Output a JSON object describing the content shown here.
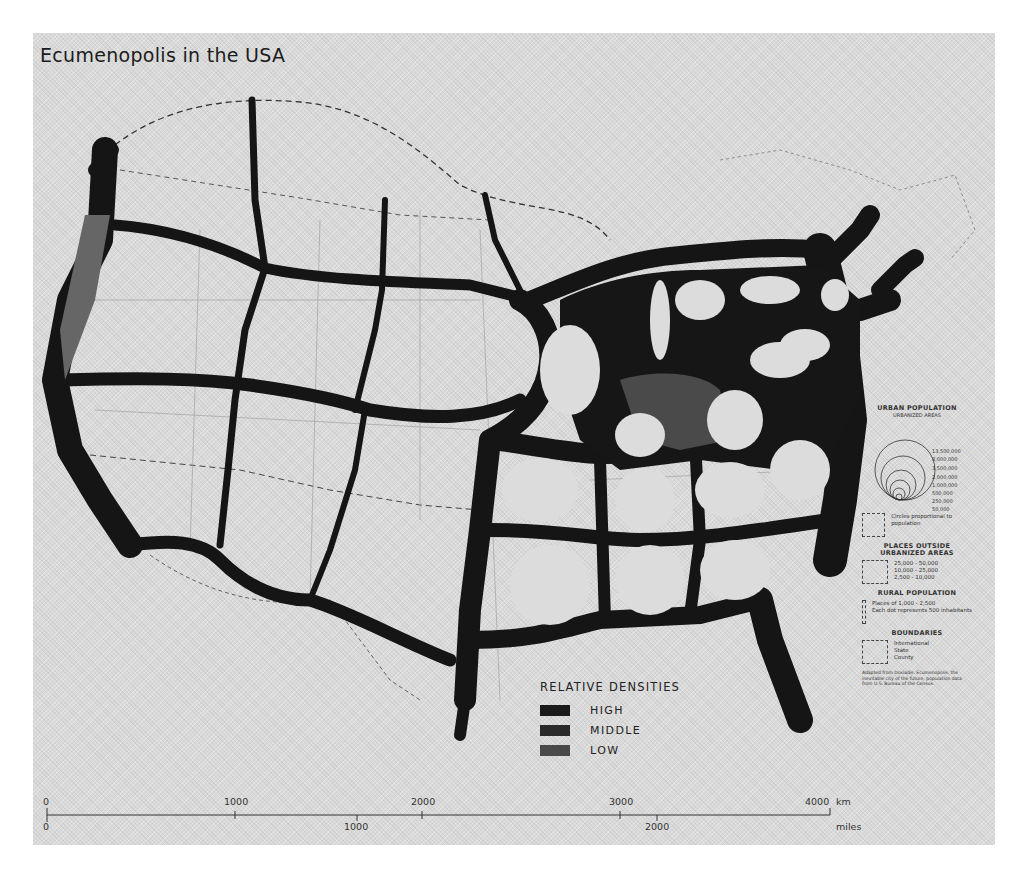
{
  "title": "Ecumenopolis in the USA",
  "relative_densities": {
    "heading": "RELATIVE DENSITIES",
    "items": [
      {
        "label": "HIGH",
        "color": "#1a1a1a"
      },
      {
        "label": "MIDDLE",
        "color": "#2a2a2a"
      },
      {
        "label": "LOW",
        "color": "#4a4a4a"
      }
    ]
  },
  "urban_population": {
    "heading": "URBAN POPULATION",
    "subheading": "URBANIZED AREAS",
    "values": [
      "13,500,000",
      "8,000,000",
      "3,500,000",
      "2,000,000",
      "1,000,000",
      "500,000",
      "250,000",
      "50,000"
    ],
    "circle_note": "Circles proportional to population"
  },
  "places_outside": {
    "heading": "PLACES OUTSIDE URBANIZED AREAS",
    "values": [
      "25,000 - 50,000",
      "10,000 - 25,000",
      "2,500 - 10,000"
    ]
  },
  "rural_population": {
    "heading": "RURAL POPULATION",
    "lines": [
      "Places of 1,000 - 2,500",
      "Each dot represents 500 inhabitants"
    ]
  },
  "boundaries": {
    "heading": "BOUNDARIES",
    "items": [
      "International",
      "State",
      "County"
    ]
  },
  "source_note": "Adapted from Doxiadis: Ecumenopolis, the inevitable city of the future; population data from U.S. Bureau of the Census.",
  "scale": {
    "km_ticks": [
      "0",
      "1000",
      "2000",
      "3000",
      "4000"
    ],
    "km_unit": "km",
    "mile_ticks": [
      "0",
      "1000",
      "2000"
    ],
    "mile_unit": "miles"
  },
  "colors": {
    "paper": "#d9d9d9",
    "ink": "#141414",
    "cell": "#dcdcdc",
    "low_density": "#555555"
  }
}
